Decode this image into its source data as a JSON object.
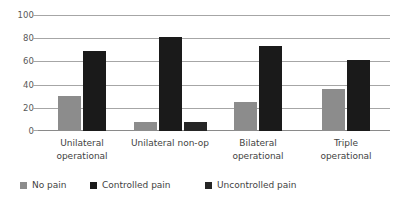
{
  "chart_data": {
    "type": "bar",
    "title": "",
    "subtitle": "",
    "xlabel": "",
    "ylabel": "",
    "ylim": [
      0,
      100
    ],
    "yticks": [
      0,
      20,
      40,
      60,
      80,
      100
    ],
    "ytick_labels": [
      "0",
      "20",
      "40",
      "60",
      "80",
      "100"
    ],
    "grid": "horizontal",
    "legend_position": "bottom",
    "categories": [
      "Unilateral operational",
      "Unilateral non-op",
      "Bilateral operational",
      "Triple operational"
    ],
    "category_lines": [
      [
        "Unilateral",
        "operational"
      ],
      [
        "Unilateral non-op",
        ""
      ],
      [
        "Bilateral",
        "operational"
      ],
      [
        "Triple",
        "operational"
      ]
    ],
    "series": [
      {
        "name": "No pain",
        "color": "#8c8c8c",
        "values": [
          30,
          8,
          25,
          36
        ]
      },
      {
        "name": "Controlled pain",
        "color": "#1a1a1a",
        "values": [
          69,
          81,
          73,
          61
        ]
      },
      {
        "name": "Uncontrolled pain",
        "color": "#262626",
        "values": [
          0,
          8,
          0,
          0
        ]
      }
    ]
  },
  "axis": {
    "y_tick_labels": [
      "100",
      "80",
      "60",
      "40",
      "20",
      "0"
    ]
  },
  "legend": {
    "items": [
      {
        "label": "No pain",
        "color": "#8c8c8c"
      },
      {
        "label": "Controlled pain",
        "color": "#1a1a1a"
      },
      {
        "label": "Uncontrolled pain",
        "color": "#262626"
      }
    ]
  },
  "colors": {
    "background": "#ffffff",
    "gridline": "#a6a6a6",
    "baseline": "#8a8a8a",
    "text": "#3f3f3f",
    "tick_text": "#595959"
  }
}
